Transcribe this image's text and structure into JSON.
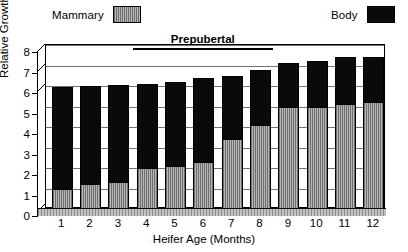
{
  "chart_data": {
    "type": "bar",
    "title": "",
    "xlabel": "Heifer Age  (Months)",
    "ylabel": "Relative Growth",
    "categories": [
      "1",
      "2",
      "3",
      "4",
      "5",
      "6",
      "7",
      "8",
      "9",
      "10",
      "11",
      "12"
    ],
    "ylim": [
      0,
      8
    ],
    "y_ticks": [
      "0",
      "1",
      "2",
      "3",
      "4",
      "5",
      "6",
      "7",
      "8"
    ],
    "grid": true,
    "legend_position": "top",
    "series": [
      {
        "name": "Mammary",
        "color": "#9a9a9a",
        "values": [
          1.0,
          1.2,
          1.3,
          2.0,
          2.1,
          2.3,
          3.4,
          4.1,
          5.0,
          5.0,
          5.1,
          5.2
        ]
      },
      {
        "name": "Body",
        "color": "#0a0a0a",
        "values": [
          5.95,
          6.0,
          6.05,
          6.1,
          6.2,
          6.4,
          6.5,
          6.8,
          7.1,
          7.2,
          7.4,
          7.4
        ]
      }
    ],
    "annotations": [
      {
        "text": "Prepubertal",
        "from_category": "4",
        "to_category": "8"
      }
    ]
  },
  "legend": {
    "mammary_label": "Mammary",
    "body_label": "Body"
  }
}
